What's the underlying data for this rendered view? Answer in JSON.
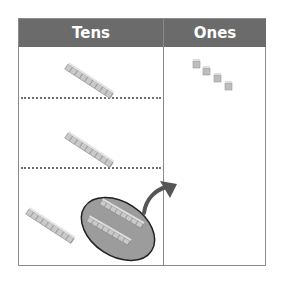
{
  "table": {
    "columns": [
      {
        "label": "Tens"
      },
      {
        "label": "Ones"
      }
    ],
    "rows": [
      {
        "tens_rods": 1,
        "ones_cubes": 4
      },
      {
        "tens_rods": 1,
        "ones_cubes": 0
      },
      {
        "tens_rods": 1,
        "ones_cubes": 0,
        "regroup_circle_rods": 2,
        "arrow_to": "Ones"
      }
    ]
  },
  "colors": {
    "header_bg": "#6b6b6b",
    "header_text": "#ffffff",
    "grid_line": "#8a8a8a",
    "block": "#c8c8c8",
    "ellipse_fill": "#9a9a9a",
    "arrow": "#555555"
  },
  "icons": {
    "tens_rod": "base-ten-rod-icon",
    "ones_cube": "unit-cube-icon",
    "arrow": "curved-arrow-icon"
  }
}
